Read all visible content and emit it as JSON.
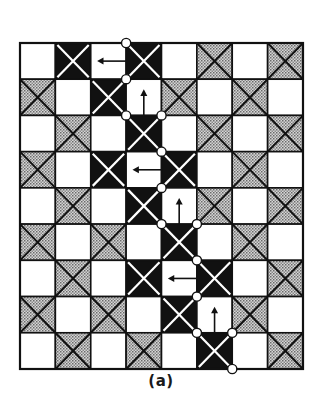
{
  "figure": {
    "caption": "(a)",
    "grid": {
      "cols": 8,
      "rows": 9,
      "cell_legend": {
        "W": "white empty cell",
        "G": "gray dotted cell with black X",
        "B": "black cell with white X",
        "WL": "white cell with left arrow",
        "WU": "white cell with up arrow"
      },
      "cells": [
        [
          "W",
          "B",
          "WL",
          "B",
          "W",
          "G",
          "W",
          "G"
        ],
        [
          "G",
          "W",
          "B",
          "WU",
          "G",
          "W",
          "G",
          "W"
        ],
        [
          "W",
          "G",
          "W",
          "B",
          "W",
          "G",
          "W",
          "G"
        ],
        [
          "G",
          "W",
          "B",
          "WL",
          "B",
          "W",
          "G",
          "W"
        ],
        [
          "W",
          "G",
          "W",
          "B",
          "WU",
          "G",
          "W",
          "G"
        ],
        [
          "G",
          "W",
          "G",
          "W",
          "B",
          "W",
          "G",
          "W"
        ],
        [
          "W",
          "G",
          "W",
          "B",
          "WL",
          "B",
          "W",
          "G"
        ],
        [
          "G",
          "W",
          "G",
          "W",
          "B",
          "WU",
          "G",
          "W"
        ],
        [
          "W",
          "G",
          "W",
          "G",
          "W",
          "B",
          "W",
          "G"
        ]
      ]
    },
    "path_nodes": [
      [
        3,
        0
      ],
      [
        3,
        1
      ],
      [
        3,
        2
      ],
      [
        4,
        2
      ],
      [
        4,
        3
      ],
      [
        4,
        4
      ],
      [
        4,
        5
      ],
      [
        5,
        5
      ],
      [
        5,
        6
      ],
      [
        5,
        7
      ],
      [
        5,
        8
      ],
      [
        6,
        8
      ],
      [
        6,
        9
      ]
    ],
    "colors": {
      "black": "#111111",
      "gray_fill": "#b8b8b8",
      "white": "#ffffff",
      "line": "#111111"
    }
  }
}
